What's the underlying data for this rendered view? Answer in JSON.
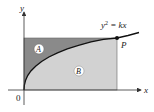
{
  "diagram": {
    "axes": {
      "x_label": "x",
      "y_label": "y",
      "origin_label": "0"
    },
    "curve": {
      "equation_lhs": "y",
      "equation_exp": "2",
      "equation_rhs": " = kx"
    },
    "point": {
      "label": "P"
    },
    "regions": [
      {
        "label": "A",
        "description": "area above curve inside rectangle",
        "color": "#8a8a8a"
      },
      {
        "label": "B",
        "description": "area below curve inside rectangle",
        "color": "#cfcfcf"
      }
    ],
    "colors": {
      "axis": "#333333",
      "curve": "#111111",
      "rect_border": "#555555"
    }
  }
}
